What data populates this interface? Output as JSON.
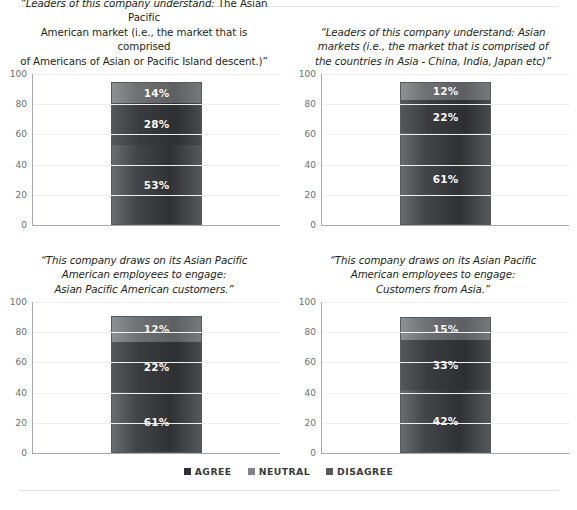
{
  "legend": {
    "items": [
      {
        "label": "AGREE",
        "key": "agree",
        "color": "#2f3034"
      },
      {
        "label": "NEUTRAL",
        "key": "neutral",
        "color": "#808285"
      },
      {
        "label": "DISAGREE",
        "key": "disagree",
        "color": "#58595b"
      }
    ]
  },
  "axis": {
    "ticks": [
      "100",
      "80",
      "60",
      "40",
      "20",
      "0"
    ],
    "min": 0,
    "max": 100
  },
  "chart_data": [
    {
      "id": "leaders-apa-market",
      "type": "bar",
      "stacked": true,
      "position": "top-left",
      "title": "“Leaders of this company understand: The Asian Pacific American market (i.e., the market that is comprised of Americans of Asian or Pacific Island descent.)”",
      "title_lines": [
        {
          "italic": "“Leaders of this company understand:",
          "roman": " The Asian Pacific"
        },
        {
          "italic": "",
          "roman": "American market (i.e., the market that is comprised"
        },
        {
          "italic": "",
          "roman": "of Americans of Asian or Pacific Island descent.)”"
        }
      ],
      "categories": [
        ""
      ],
      "series": [
        {
          "name": "AGREE",
          "values": [
            53
          ],
          "label": "53%",
          "height": 53
        },
        {
          "name": "NEUTRAL",
          "values": [
            28
          ],
          "label": "28%",
          "height": 28
        },
        {
          "name": "DISAGREE",
          "values": [
            14
          ],
          "label": "14%",
          "height": 14
        }
      ],
      "ylim": [
        0,
        100
      ],
      "ylabel": "",
      "xlabel": "",
      "grid": true,
      "legend_position": "bottom-shared"
    },
    {
      "id": "leaders-asian-markets",
      "type": "bar",
      "stacked": true,
      "position": "top-right",
      "title": "“Leaders of this company understand: Asian markets (i.e., the market that is comprised of the countries in Asia - China, India, Japan etc)”",
      "title_lines": [
        {
          "italic": "“Leaders of this company understand: Asian",
          "roman": ""
        },
        {
          "italic": "markets (i.e., the market that is comprised of",
          "roman": ""
        },
        {
          "italic": "the countries in Asia - China, India, Japan etc)”",
          "roman": ""
        }
      ],
      "categories": [
        ""
      ],
      "series": [
        {
          "name": "AGREE",
          "values": [
            61
          ],
          "label": "61%",
          "height": 61
        },
        {
          "name": "NEUTRAL",
          "values": [
            22
          ],
          "label": "22%",
          "height": 22
        },
        {
          "name": "DISAGREE",
          "values": [
            12
          ],
          "label": "12%",
          "height": 12
        }
      ],
      "ylim": [
        0,
        100
      ],
      "ylabel": "",
      "xlabel": "",
      "grid": true,
      "legend_position": "bottom-shared"
    },
    {
      "id": "draws-apa-customers",
      "type": "bar",
      "stacked": true,
      "position": "bottom-left",
      "title": "“This company draws on its Asian Pacific American employees to engage: Asian Pacific American customers.”",
      "title_lines": [
        {
          "italic": "“This company draws on its Asian Pacific",
          "roman": ""
        },
        {
          "italic": "American employees to engage:",
          "roman": ""
        },
        {
          "italic": "Asian Pacific American customers.”",
          "roman": ""
        }
      ],
      "categories": [
        ""
      ],
      "series": [
        {
          "name": "AGREE",
          "values": [
            61
          ],
          "label": "61%",
          "height": 40
        },
        {
          "name": "NEUTRAL",
          "values": [
            22
          ],
          "label": "22%",
          "height": 34
        },
        {
          "name": "DISAGREE",
          "values": [
            12
          ],
          "label": "12%",
          "height": 17
        }
      ],
      "ylim": [
        0,
        100
      ],
      "ylabel": "",
      "xlabel": "",
      "grid": true,
      "legend_position": "bottom-shared"
    },
    {
      "id": "draws-asia-customers",
      "type": "bar",
      "stacked": true,
      "position": "bottom-right",
      "title": "“This company draws on its Asian Pacific American employees to engage: Customers from Asia.”",
      "title_lines": [
        {
          "italic": "“This company draws on its Asian Pacific",
          "roman": ""
        },
        {
          "italic": "American employees to engage:",
          "roman": ""
        },
        {
          "italic": "Customers from Asia.”",
          "roman": ""
        }
      ],
      "categories": [
        ""
      ],
      "series": [
        {
          "name": "AGREE",
          "values": [
            42
          ],
          "label": "42%",
          "height": 42
        },
        {
          "name": "NEUTRAL",
          "values": [
            33
          ],
          "label": "33%",
          "height": 33
        },
        {
          "name": "DISAGREE",
          "values": [
            15
          ],
          "label": "15%",
          "height": 15
        }
      ],
      "ylim": [
        0,
        100
      ],
      "ylabel": "",
      "xlabel": "",
      "grid": true,
      "legend_position": "bottom-shared"
    }
  ]
}
